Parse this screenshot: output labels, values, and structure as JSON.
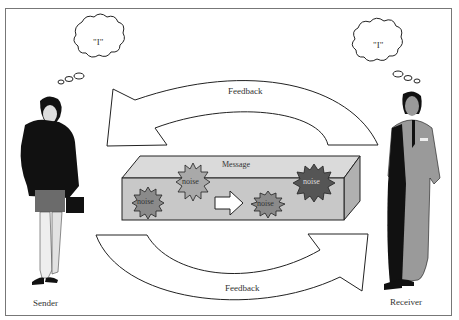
{
  "diagram": {
    "sender": {
      "label": "Sender",
      "thought": "\"I\""
    },
    "receiver": {
      "label": "Receiver",
      "thought": "\"I\""
    },
    "message": {
      "label": "Message",
      "noise_labels": [
        "noise",
        "noise",
        "noise",
        "noise"
      ]
    },
    "feedback_top": {
      "label": "Feedback"
    },
    "feedback_bottom": {
      "label": "Feedback"
    },
    "colors": {
      "box_fill": "#c8c8c8",
      "box_top": "#dadada",
      "box_side": "#b0b0b0",
      "noise_light": "#a9a9a9",
      "noise_mid": "#8a8a8a",
      "noise_dark": "#555555",
      "stroke": "#222222"
    }
  }
}
